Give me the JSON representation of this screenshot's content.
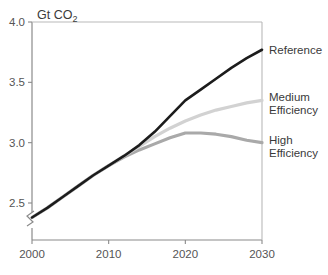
{
  "chart_data": {
    "type": "line",
    "title": "",
    "subtitle": "",
    "xlabel": "",
    "ylabel": "Gt CO2",
    "ylabel_main": "Gt CO",
    "ylabel_sub": "2",
    "xlim": [
      2000,
      2030
    ],
    "ylim": [
      2.3,
      4.0
    ],
    "y_axis_break": true,
    "grid": false,
    "legend_position": "right-of-plot-at-line-ends",
    "xticks": [
      2000,
      2010,
      2020,
      2030
    ],
    "xtick_labels": [
      "2000",
      "2010",
      "2020",
      "2030"
    ],
    "yticks": [
      2.5,
      3.0,
      3.5,
      4.0
    ],
    "ytick_labels": [
      "2.5",
      "3.0",
      "3.5",
      "4.0"
    ],
    "x": [
      2000,
      2002,
      2004,
      2006,
      2008,
      2010,
      2012,
      2014,
      2016,
      2018,
      2020,
      2022,
      2024,
      2026,
      2028,
      2030
    ],
    "series": [
      {
        "name": "Reference",
        "label_line1": "Reference",
        "label_line2": "",
        "color": "#1c1c1c",
        "width": 2.6,
        "values": [
          2.38,
          2.46,
          2.55,
          2.64,
          2.73,
          2.81,
          2.89,
          2.98,
          3.09,
          3.22,
          3.35,
          3.44,
          3.53,
          3.62,
          3.7,
          3.77
        ]
      },
      {
        "name": "Medium Efficiency",
        "label_line1": "Medium",
        "label_line2": "Efficiency",
        "color": "#d2d2d2",
        "width": 3.2,
        "values": [
          2.38,
          2.46,
          2.55,
          2.64,
          2.73,
          2.81,
          2.89,
          2.97,
          3.05,
          3.12,
          3.18,
          3.23,
          3.27,
          3.3,
          3.33,
          3.35
        ]
      },
      {
        "name": "High Efficiency",
        "label_line1": "High",
        "label_line2": "Efficiency",
        "color": "#a9a9a9",
        "width": 3.2,
        "values": [
          2.38,
          2.46,
          2.55,
          2.64,
          2.73,
          2.81,
          2.88,
          2.94,
          2.99,
          3.04,
          3.08,
          3.08,
          3.07,
          3.05,
          3.02,
          3.0
        ]
      }
    ]
  },
  "axis": {
    "color": "#8a8a8a",
    "break_symbol": "axis-break"
  }
}
